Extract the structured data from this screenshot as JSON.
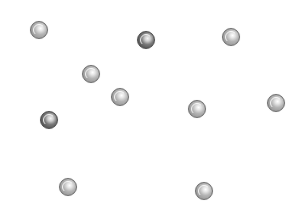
{
  "scene": {
    "type": "ball-field",
    "background": "#ffffff",
    "ball_radius": 9,
    "balls": [
      {
        "id": 1,
        "x": 39,
        "y": 30,
        "variant": "light"
      },
      {
        "id": 2,
        "x": 146,
        "y": 40,
        "variant": "dark"
      },
      {
        "id": 3,
        "x": 231,
        "y": 37,
        "variant": "light"
      },
      {
        "id": 4,
        "x": 91,
        "y": 74,
        "variant": "light"
      },
      {
        "id": 5,
        "x": 120,
        "y": 97,
        "variant": "light"
      },
      {
        "id": 6,
        "x": 197,
        "y": 109,
        "variant": "light"
      },
      {
        "id": 7,
        "x": 276,
        "y": 103,
        "variant": "light"
      },
      {
        "id": 8,
        "x": 49,
        "y": 120,
        "variant": "dark"
      },
      {
        "id": 9,
        "x": 68,
        "y": 187,
        "variant": "light"
      },
      {
        "id": 10,
        "x": 204,
        "y": 191,
        "variant": "light"
      }
    ],
    "colors": {
      "light_ball": "#a8a8a8",
      "dark_ball": "#5a5a5a",
      "outline": "#6e6e6e"
    }
  }
}
